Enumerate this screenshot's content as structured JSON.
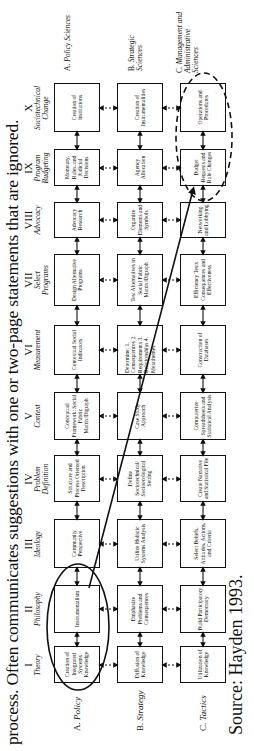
{
  "caption": "process. Often communicates suggestions with one or two-page statements that are ignored.",
  "source": "Source:  Hayden 1993.",
  "columns": [
    {
      "num": "I",
      "sub": "Theory"
    },
    {
      "num": "II",
      "sub": "Philosophy"
    },
    {
      "num": "III",
      "sub": "Ideology"
    },
    {
      "num": "IV",
      "sub": "Problem Definition"
    },
    {
      "num": "V",
      "sub": "Context"
    },
    {
      "num": "VI",
      "sub": "Measurement"
    },
    {
      "num": "VII",
      "sub": "Select Programs"
    },
    {
      "num": "VIII",
      "sub": "Advocacy"
    },
    {
      "num": "IX",
      "sub": "Program Budgeting"
    },
    {
      "num": "X",
      "sub": "Sociotechnical Change"
    }
  ],
  "rows": [
    {
      "letter": "A.",
      "name": "Policy",
      "sciences_letter": "A.",
      "sciences": "Policy Sciences"
    },
    {
      "letter": "B.",
      "name": "Strategy",
      "sciences_letter": "B.",
      "sciences": "Strategic Sciences"
    },
    {
      "letter": "C.",
      "name": "Tactics",
      "sciences_letter": "C.",
      "sciences": "Management and Administrative Sciences"
    }
  ],
  "cells": {
    "A": [
      "Creation of Integrated Systems Knowledge",
      "Instrumentalism",
      "Community Perspective",
      "Structure and Process Oriented Description",
      "Conceptual Framework: Social Fabric Matrix/Digraph",
      "Contextual Social Indicators",
      "Design Alternative Programs",
      "Advocacy Research",
      "Monetary, Rules, and Judicial Decisions",
      "Creation of Institutions"
    ],
    "B": [
      "Diffusion of Knowledge",
      "Emphasize Problems and Consequences",
      "Utilize Holistic Systems Analysis",
      "Define Sociotechnical/ Socioecological Setting",
      "Case Study Approach",
      "Determine: 1. Consequences 2. Requirements 3. Relationships 4. Metathemes",
      "Test Alternatives in Social Fabric Matrix/Digraph",
      "Organize Elements and Symbols",
      "Agency Allocation",
      "Creation of Instrumentalities"
    ],
    "C": [
      "Utilization of Knowledge",
      "Build Participatory Democracy",
      "Select Beliefs, Attitudes, Actions, and Criteria",
      "Create Narrative and Statistical File",
      "Computerize Spreadsheets and Statistical Analysis",
      "Construction of Databases",
      "Efficiency Tests Consequences and Effectiveness",
      "Networking and Lobbying",
      "Budget Requests and Rule Changes",
      "Operations and Procedures"
    ]
  }
}
